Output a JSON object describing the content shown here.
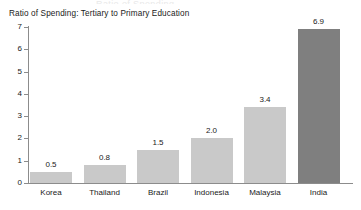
{
  "chart_data": {
    "type": "bar",
    "title": "Ratio of Spending: Tertiary to Primary Education",
    "xlabel": "",
    "ylabel": "",
    "categories": [
      "Korea",
      "Thailand",
      "Brazil",
      "Indonesia",
      "Malaysia",
      "India"
    ],
    "values": [
      0.5,
      0.8,
      1.5,
      2.0,
      3.4,
      6.9
    ],
    "value_labels": [
      "0.5",
      "0.8",
      "1.5",
      "2.0",
      "3.4",
      "6.9"
    ],
    "ylim": [
      0,
      7
    ],
    "y_ticks": [
      0,
      1,
      2,
      3,
      4,
      5,
      6,
      7
    ],
    "y_tick_labels": [
      "0",
      "1",
      "2",
      "3",
      "4",
      "5",
      "6",
      "7"
    ],
    "grid": false,
    "legend": null,
    "bar_color": "#c9c9c9",
    "highlight_color": "#7f7f7f",
    "highlight_category": "India",
    "axis_color": "#8c8c8c",
    "text_color": "#1a1a1a",
    "background": "#ffffff"
  },
  "artifacts": {
    "top_clipped_text": "Ratio of Spending"
  }
}
